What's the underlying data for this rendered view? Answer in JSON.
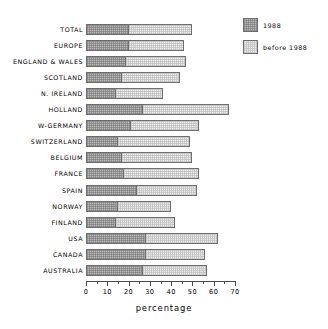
{
  "chart_data": {
    "type": "bar",
    "orientation": "horizontal",
    "stacked": true,
    "title": "",
    "xlabel": "percentage",
    "ylabel": "",
    "xlim": [
      0,
      70
    ],
    "xticks": [
      0,
      10,
      20,
      30,
      40,
      50,
      60,
      70
    ],
    "xtick_labels": [
      "0",
      "10",
      "20",
      "30",
      "40",
      "50",
      "60",
      "70"
    ],
    "minor_tick_interval": 5,
    "grid": false,
    "legend_position": "top-right",
    "categories": [
      "TOTAL",
      "EUROPE",
      "ENGLAND & WALES",
      "SCOTLAND",
      "N. IRELAND",
      "HOLLAND",
      "W-GERMANY",
      "SWITZERLAND",
      "BELGIUM",
      "FRANCE",
      "SPAIN",
      "NORWAY",
      "FINLAND",
      "USA",
      "CANADA",
      "AUSTRALIA"
    ],
    "series": [
      {
        "name": "1988",
        "color": "#b6b6b6",
        "values": [
          20,
          20,
          19,
          17,
          14,
          27,
          21,
          15,
          17,
          18,
          24,
          15,
          14,
          28,
          28,
          27
        ]
      },
      {
        "name": "before 1988",
        "color": "#ececeb",
        "values": [
          30,
          26,
          28,
          27,
          22,
          40,
          32,
          34,
          33,
          35,
          28,
          25,
          28,
          34,
          28,
          30
        ]
      }
    ],
    "totals": [
      50,
      46,
      47,
      44,
      36,
      67,
      53,
      49,
      50,
      53,
      52,
      40,
      42,
      62,
      56,
      57
    ]
  },
  "legend": {
    "items": [
      {
        "label": "1988"
      },
      {
        "label": "before 1988"
      }
    ]
  },
  "axis": {
    "title": "percentage"
  }
}
